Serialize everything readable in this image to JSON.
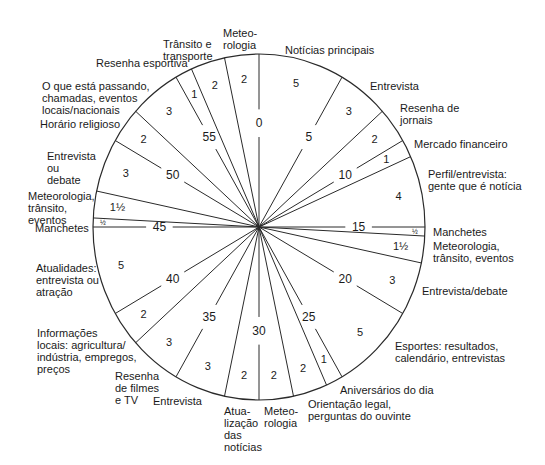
{
  "diagram": {
    "type": "radio-hour-clock",
    "total_minutes": 60,
    "center": [
      259,
      227
    ],
    "radius_x": 166,
    "radius_y": 173,
    "line_color": "#2a2a2a",
    "tick_labels": [
      {
        "minute": 0,
        "label": "0"
      },
      {
        "minute": 5,
        "label": "5"
      },
      {
        "minute": 10,
        "label": "10"
      },
      {
        "minute": 15,
        "label": "15"
      },
      {
        "minute": 20,
        "label": "20"
      },
      {
        "minute": 25,
        "label": "25"
      },
      {
        "minute": 30,
        "label": "30"
      },
      {
        "minute": 35,
        "label": "35"
      },
      {
        "minute": 40,
        "label": "40"
      },
      {
        "minute": 45,
        "label": "45"
      },
      {
        "minute": 50,
        "label": "50"
      },
      {
        "minute": 55,
        "label": "55"
      }
    ],
    "segments": [
      {
        "start": 0,
        "duration": 5,
        "duration_label": "5",
        "label": "Notícias principais"
      },
      {
        "start": 5,
        "duration": 3,
        "duration_label": "3",
        "label": "Entrevista"
      },
      {
        "start": 8,
        "duration": 2,
        "duration_label": "2",
        "label": "Resenha de\njornais"
      },
      {
        "start": 10,
        "duration": 1,
        "duration_label": "1",
        "label": "Mercado financeiro"
      },
      {
        "start": 11,
        "duration": 4,
        "duration_label": "4",
        "label": "Perfil/entrevista:\ngente que é notícia"
      },
      {
        "start": 15,
        "duration": 0.5,
        "duration_label": "½",
        "label": "Manchetes"
      },
      {
        "start": 15.5,
        "duration": 1.5,
        "duration_label": "1½",
        "label": "Meteorologia,\ntrânsito, eventos"
      },
      {
        "start": 17,
        "duration": 3,
        "duration_label": "3",
        "label": "Entrevista/debate"
      },
      {
        "start": 20,
        "duration": 5,
        "duration_label": "5",
        "label": "Esportes: resultados,\ncalendário, entrevistas"
      },
      {
        "start": 25,
        "duration": 1,
        "duration_label": "1",
        "label": "Aniversários do dia"
      },
      {
        "start": 26,
        "duration": 2,
        "duration_label": "2",
        "label": "Orientação legal,\nperguntas do ouvinte"
      },
      {
        "start": 28,
        "duration": 2,
        "duration_label": "2",
        "label": "Meteo-\nrologia"
      },
      {
        "start": 30,
        "duration": 2,
        "duration_label": "2",
        "label": "Atua-\nlização\ndas\nnotícias"
      },
      {
        "start": 32,
        "duration": 3,
        "duration_label": "3",
        "label": "Entrevista"
      },
      {
        "start": 35,
        "duration": 3,
        "duration_label": "3",
        "label": "Resenha\nde filmes\ne TV"
      },
      {
        "start": 38,
        "duration": 2,
        "duration_label": "2",
        "label": "Informações\nlocais: agricultura/\nindústria, empregos,\npreços"
      },
      {
        "start": 40,
        "duration": 5,
        "duration_label": "5",
        "label": "Atualidades:\nentrevista ou\natração"
      },
      {
        "start": 45,
        "duration": 0.5,
        "duration_label": "½",
        "label": "Manchetes"
      },
      {
        "start": 45.5,
        "duration": 1.5,
        "duration_label": "1½",
        "label": "Meteorologia,\ntrânsito,\neventos"
      },
      {
        "start": 47,
        "duration": 3,
        "duration_label": "3",
        "label": "Entrevista\nou\ndebate"
      },
      {
        "start": 50,
        "duration": 2,
        "duration_label": "2",
        "label": "Horário religioso"
      },
      {
        "start": 52,
        "duration": 3,
        "duration_label": "3",
        "label": "O que está passando,\nchamadas, eventos\nlocais/nacionais"
      },
      {
        "start": 55,
        "duration": 1,
        "duration_label": "1",
        "label": "Resenha esportiva"
      },
      {
        "start": 56,
        "duration": 2,
        "duration_label": "2",
        "label": "Trânsito e\ntransporte"
      },
      {
        "start": 58,
        "duration": 2,
        "duration_label": "2",
        "label": "Meteo-\nrologia"
      }
    ]
  },
  "outer_labels": [
    {
      "text": "Meteo-\nrologia",
      "x": 223,
      "y": 27,
      "align": "left"
    },
    {
      "text": "Trânsito e\ntransporte",
      "x": 163,
      "y": 38,
      "align": "left"
    },
    {
      "text": "Notícias principais",
      "x": 285,
      "y": 44,
      "align": "left"
    },
    {
      "text": "Resenha esportiva",
      "x": 96,
      "y": 57,
      "align": "left"
    },
    {
      "text": "O que está passando,\nchamadas, eventos\nlocais/nacionais",
      "x": 42,
      "y": 80,
      "align": "left"
    },
    {
      "text": "Horário religioso",
      "x": 40,
      "y": 118,
      "align": "left"
    },
    {
      "text": "Entrevista\nou\ndebate",
      "x": 47,
      "y": 150,
      "align": "left"
    },
    {
      "text": "Meteorologia,\ntrânsito,\neventos",
      "x": 28,
      "y": 190,
      "align": "left"
    },
    {
      "text": "Manchetes",
      "x": 35,
      "y": 222,
      "align": "left"
    },
    {
      "text": "Atualidades:\nentrevista ou\natração",
      "x": 36,
      "y": 262,
      "align": "left"
    },
    {
      "text": "Informações\nlocais: agricultura/\nindústria, empregos,\npreços",
      "x": 37,
      "y": 327,
      "align": "left"
    },
    {
      "text": "Resenha\nde filmes\ne TV",
      "x": 115,
      "y": 370,
      "align": "left"
    },
    {
      "text": "Entrevista",
      "x": 153,
      "y": 395,
      "align": "left"
    },
    {
      "text": "Atua-\nlização\ndas\nnotícias",
      "x": 224,
      "y": 405,
      "align": "left"
    },
    {
      "text": "Meteo-\nrologia",
      "x": 264,
      "y": 405,
      "align": "left"
    },
    {
      "text": "Orientação legal,\nperguntas do ouvinte",
      "x": 308,
      "y": 398,
      "align": "left"
    },
    {
      "text": "Aniversários do dia",
      "x": 340,
      "y": 384,
      "align": "left"
    },
    {
      "text": "Esportes: resultados,\ncalendário, entrevistas",
      "x": 395,
      "y": 340,
      "align": "left"
    },
    {
      "text": "Entrevista/debate",
      "x": 422,
      "y": 285,
      "align": "left"
    },
    {
      "text": "Meteorologia,\ntrânsito, eventos",
      "x": 433,
      "y": 240,
      "align": "left"
    },
    {
      "text": "Manchetes",
      "x": 433,
      "y": 226,
      "align": "left"
    },
    {
      "text": "Perfil/entrevista:\ngente que é notícia",
      "x": 428,
      "y": 168,
      "align": "left"
    },
    {
      "text": "Mercado financeiro",
      "x": 414,
      "y": 138,
      "align": "left"
    },
    {
      "text": "Resenha de\njornais",
      "x": 400,
      "y": 102,
      "align": "left"
    },
    {
      "text": "Entrevista",
      "x": 370,
      "y": 80,
      "align": "left"
    }
  ]
}
